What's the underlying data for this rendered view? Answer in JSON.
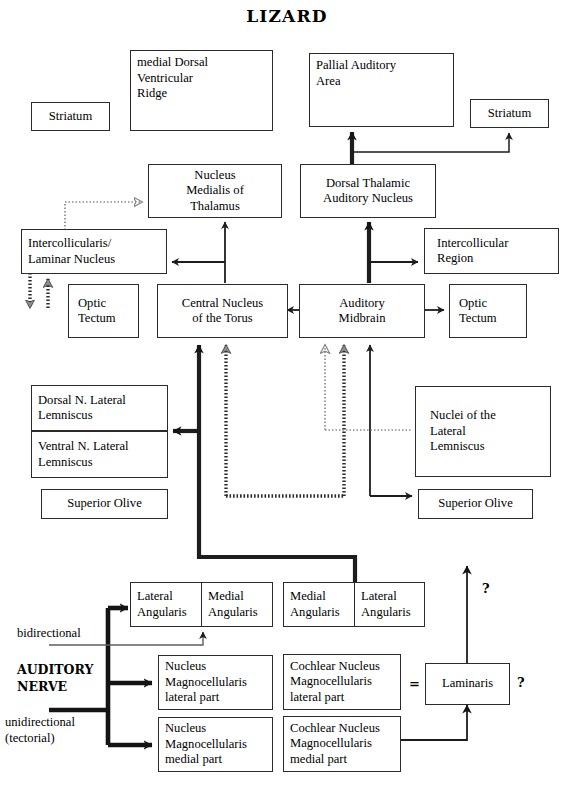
{
  "diagram": {
    "title": "LIZARD",
    "boxes": {
      "striatum_left": "Striatum",
      "mdvr": "medial Dorsal\nVentricular\nRidge",
      "pallial_auditory_area": "Pallial Auditory\nArea",
      "striatum_right": "Striatum",
      "nucleus_medialis_thalamus": "Nucleus\nMedialis of\nThalamus",
      "dorsal_thalamic_auditory_nucleus": "Dorsal Thalamic\nAuditory Nucleus",
      "intercollicularis_laminar": "Intercollicularis/\nLaminar Nucleus",
      "intercollicular_region": "Intercollicular\nRegion",
      "optic_tectum_left": "Optic\nTectum",
      "central_nucleus_torus": "Central Nucleus\nof the Torus",
      "auditory_midbrain": "Auditory\nMidbrain",
      "optic_tectum_right": "Optic\nTectum",
      "dorsal_n_lateral_lemniscus": "Dorsal N. Lateral\nLemniscus",
      "ventral_n_lateral_lemniscus": "Ventral N. Lateral\nLemniscus",
      "superior_olive_left": "Superior Olive",
      "nuclei_lateral_lemniscus": "Nuclei of the\nLateral\nLemniscus",
      "superior_olive_right": "Superior Olive",
      "lateral_angularis_left": "Lateral\nAngularis",
      "medial_angularis_left": "Medial\nAngularis",
      "medial_angularis_right": "Medial\nAngularis",
      "lateral_angularis_right": "Lateral\nAngularis",
      "nucleus_magnocellularis_lateral": "Nucleus\nMagnocellularis\nlateral part",
      "cochlear_nucleus_magnocellularis_lateral": "Cochlear Nucleus\nMagnocellularis\nlateral part",
      "nucleus_magnocellularis_medial": "Nucleus\nMagnocellularis\nmedial part",
      "cochlear_nucleus_magnocellularis_medial": "Cochlear Nucleus\nMagnocellularis\nmedial part",
      "laminaris": "Laminaris"
    },
    "labels": {
      "bidirectional": "bidirectional",
      "auditory_nerve": "AUDITORY\nNERVE",
      "unidirectional": "unidirectional\n(tectorial)",
      "equals_sign": "=",
      "question_top": "?",
      "question_right": "?"
    },
    "colors": {
      "stroke": "#2b2b2b",
      "background": "#ffffff",
      "text": "#000000"
    }
  }
}
